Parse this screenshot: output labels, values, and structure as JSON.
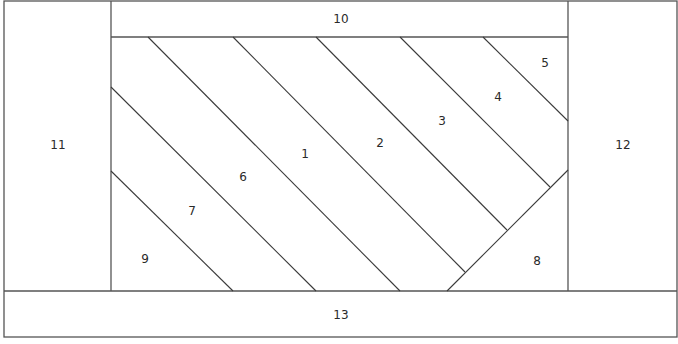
{
  "diagram": {
    "title": "",
    "type": "foundation-piecing pattern",
    "line_color": "#3a3a3a",
    "background": "#ffffff",
    "pieces": [
      {
        "label": "1",
        "x": 305,
        "y": 154
      },
      {
        "label": "2",
        "x": 380,
        "y": 143
      },
      {
        "label": "3",
        "x": 442,
        "y": 121
      },
      {
        "label": "4",
        "x": 498,
        "y": 97
      },
      {
        "label": "5",
        "x": 545,
        "y": 63
      },
      {
        "label": "6",
        "x": 243,
        "y": 177
      },
      {
        "label": "7",
        "x": 192,
        "y": 211
      },
      {
        "label": "8",
        "x": 537,
        "y": 261
      },
      {
        "label": "9",
        "x": 145,
        "y": 259
      },
      {
        "label": "10",
        "x": 341,
        "y": 19
      },
      {
        "label": "11",
        "x": 58,
        "y": 145
      },
      {
        "label": "12",
        "x": 623,
        "y": 145
      },
      {
        "label": "13",
        "x": 341,
        "y": 315
      }
    ]
  }
}
